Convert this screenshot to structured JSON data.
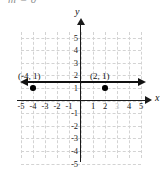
{
  "equation": {
    "text": "m = 0",
    "clipped": true
  },
  "chart_data": {
    "type": "line",
    "title": "",
    "xlabel": "x",
    "ylabel": "y",
    "xlim": [
      -5,
      5
    ],
    "ylim": [
      -5,
      5
    ],
    "grid": true,
    "legend": "none",
    "x_ticks": [
      "-5",
      "-4",
      "-3",
      "-2",
      "-1",
      "1",
      "2",
      "3",
      "4",
      "5"
    ],
    "y_ticks": [
      "5",
      "4",
      "3",
      "2",
      "1",
      "-1",
      "-2",
      "-3",
      "-4",
      "-5"
    ],
    "series": [
      {
        "name": "y = 1",
        "type": "line",
        "equation": "y = 1",
        "slope": 0,
        "y_intercept": 1,
        "arrows": "both",
        "x": [
          -5,
          5
        ],
        "values": [
          1,
          1
        ]
      }
    ],
    "points": [
      {
        "label": "(-4, 1)",
        "x": -4,
        "y": 1
      },
      {
        "label": "(2, 1)",
        "x": 2,
        "y": 1
      }
    ],
    "annotations": [
      {
        "text": "(-4, 1)",
        "x": -4,
        "y": 1
      },
      {
        "text": "(2, 1)",
        "x": 2,
        "y": 1
      }
    ]
  },
  "axes": {
    "x_name": "x",
    "y_name": "y"
  },
  "ticks": {
    "x": [
      {
        "label": "-5",
        "value": -5,
        "faded": false
      },
      {
        "label": "-4",
        "value": -4,
        "faded": false
      },
      {
        "label": "-3",
        "value": -3,
        "faded": false
      },
      {
        "label": "-2",
        "value": -2,
        "faded": false
      },
      {
        "label": "-1",
        "value": -1,
        "faded": false
      },
      {
        "label": "1",
        "value": 1,
        "faded": false
      },
      {
        "label": "2",
        "value": 2,
        "faded": false
      },
      {
        "label": "3",
        "value": 3,
        "faded": true
      },
      {
        "label": "4",
        "value": 4,
        "faded": false
      },
      {
        "label": "5",
        "value": 5,
        "faded": false
      }
    ],
    "y": [
      {
        "label": "5",
        "value": 5
      },
      {
        "label": "4",
        "value": 4
      },
      {
        "label": "3",
        "value": 3
      },
      {
        "label": "2",
        "value": 2
      },
      {
        "label": "1",
        "value": 1
      },
      {
        "label": "-1",
        "value": -1
      },
      {
        "label": "-2",
        "value": -2
      },
      {
        "label": "-3",
        "value": -3
      },
      {
        "label": "-4",
        "value": -4
      },
      {
        "label": "-5",
        "value": -5
      }
    ]
  },
  "colors": {
    "axis": "#1a1a1a",
    "grid": "#d3d3d3",
    "line": "#111111",
    "point": "#000000",
    "background": "#ffffff"
  }
}
